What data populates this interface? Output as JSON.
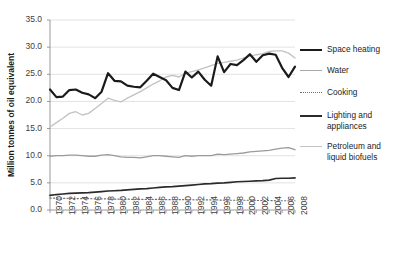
{
  "chart_data": {
    "type": "line",
    "title": "",
    "xlabel": "",
    "ylabel": "Million tonnes of oil equivalent",
    "ylim": [
      0.0,
      35.0
    ],
    "yticks": [
      "0.0",
      "5.0",
      "10.0",
      "15.0",
      "20.0",
      "25.0",
      "30.0",
      "35.0"
    ],
    "grid": true,
    "legend_position": "right",
    "x": [
      1970,
      1971,
      1972,
      1973,
      1974,
      1975,
      1976,
      1977,
      1978,
      1979,
      1980,
      1981,
      1982,
      1983,
      1984,
      1985,
      1986,
      1987,
      1988,
      1989,
      1990,
      1991,
      1992,
      1993,
      1994,
      1995,
      1996,
      1997,
      1998,
      1999,
      2000,
      2001,
      2002,
      2003,
      2004,
      2005,
      2006,
      2007,
      2008
    ],
    "xticks": [
      "1970",
      "1972",
      "1974",
      "1976",
      "1978",
      "1980",
      "1982",
      "1984",
      "1986",
      "1988",
      "1990",
      "1992",
      "1994",
      "1996",
      "1998",
      "2000",
      "2002",
      "2004",
      "2006",
      "2008"
    ],
    "series": [
      {
        "name": "Space heating",
        "color": "#1a1a1a",
        "style": "solid",
        "width": 2.2,
        "values": [
          22.2,
          20.8,
          20.9,
          22.1,
          22.2,
          21.6,
          21.3,
          20.6,
          21.8,
          25.2,
          23.8,
          23.7,
          22.9,
          22.7,
          22.6,
          23.8,
          25.1,
          24.5,
          23.9,
          22.5,
          22.1,
          25.5,
          24.4,
          25.5,
          24.0,
          22.9,
          28.3,
          25.4,
          26.9,
          26.7,
          27.6,
          28.7,
          27.3,
          28.5,
          28.8,
          28.6,
          26.2,
          24.5,
          26.4
        ]
      },
      {
        "name": "Water",
        "color": "#9b9b9b",
        "style": "solid",
        "width": 1.3,
        "values": [
          9.9,
          10.0,
          10.0,
          10.1,
          10.1,
          10.0,
          9.9,
          9.9,
          10.1,
          10.2,
          10.0,
          9.8,
          9.7,
          9.7,
          9.6,
          9.8,
          10.0,
          10.0,
          9.9,
          9.8,
          9.7,
          10.0,
          9.9,
          10.0,
          10.0,
          10.0,
          10.3,
          10.2,
          10.3,
          10.4,
          10.5,
          10.7,
          10.8,
          10.9,
          11.0,
          11.2,
          11.4,
          11.5,
          11.1
        ]
      },
      {
        "name": "Cooking",
        "color": "#6f6f6f",
        "style": "dotted",
        "width": 1.2,
        "values": [
          2.2,
          2.2,
          2.15,
          2.15,
          2.1,
          2.1,
          2.1,
          2.05,
          2.05,
          2.05,
          2.0,
          2.0,
          2.0,
          1.95,
          1.95,
          1.95,
          1.95,
          1.95,
          1.9,
          1.9,
          1.9,
          1.9,
          1.9,
          1.85,
          1.85,
          1.85,
          1.85,
          1.8,
          1.8,
          1.8,
          1.8,
          1.8,
          1.75,
          1.75,
          1.75,
          1.7,
          1.7,
          1.7,
          1.7
        ]
      },
      {
        "name": "Lighting and appliances",
        "color": "#2b2b2b",
        "style": "solid",
        "width": 1.7,
        "values": [
          2.7,
          2.85,
          2.95,
          3.05,
          3.1,
          3.15,
          3.2,
          3.3,
          3.4,
          3.5,
          3.55,
          3.6,
          3.7,
          3.8,
          3.9,
          3.95,
          4.05,
          4.15,
          4.25,
          4.3,
          4.4,
          4.5,
          4.6,
          4.7,
          4.8,
          4.85,
          4.95,
          5.0,
          5.1,
          5.2,
          5.25,
          5.3,
          5.35,
          5.4,
          5.5,
          5.8,
          5.85,
          5.85,
          5.9
        ]
      },
      {
        "name": "Petroleum and liquid biofuels",
        "color": "#c2c2c2",
        "style": "solid",
        "width": 1.3,
        "values": [
          15.3,
          16.1,
          16.9,
          17.8,
          18.1,
          17.5,
          17.8,
          18.7,
          19.6,
          20.6,
          20.2,
          19.9,
          20.6,
          21.2,
          21.8,
          22.5,
          23.2,
          23.8,
          24.5,
          24.8,
          24.5,
          25.2,
          25.5,
          25.8,
          26.2,
          26.6,
          27.0,
          27.2,
          27.4,
          27.6,
          28.0,
          28.3,
          28.6,
          28.8,
          29.2,
          29.3,
          29.3,
          28.9,
          28.0
        ]
      }
    ]
  },
  "legend": {
    "items": [
      {
        "label": "Space heating"
      },
      {
        "label": "Water"
      },
      {
        "label": "Cooking"
      },
      {
        "label": "Lighting and appliances"
      },
      {
        "label": "Petroleum and liquid biofuels"
      }
    ]
  }
}
